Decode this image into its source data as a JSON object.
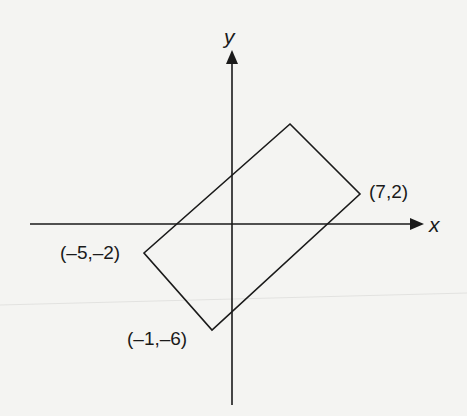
{
  "diagram": {
    "type": "coordinate-plane",
    "background_color": "#f4f4f2",
    "stroke_color": "#1a1a1a",
    "axes": {
      "x_label": "x",
      "y_label": "y"
    },
    "shape": {
      "kind": "rectangle",
      "vertices": [
        {
          "x": 7,
          "y": 2,
          "label": "(7,2)"
        },
        {
          "x": -5,
          "y": -2,
          "label": "(–5,–2)"
        },
        {
          "x": -1,
          "y": -6,
          "label": "(–1,–6)"
        },
        {
          "x": 3,
          "y": 6,
          "label": ""
        }
      ]
    }
  }
}
